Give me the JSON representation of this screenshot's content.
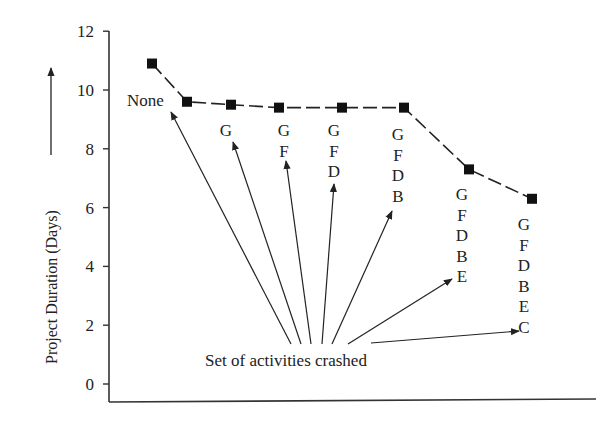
{
  "chart_data": {
    "type": "line",
    "title": "",
    "xlabel": "",
    "ylabel": "Project Duration (Days)",
    "ylim": [
      0,
      12
    ],
    "yticks": [
      0,
      2,
      4,
      6,
      8,
      10,
      12
    ],
    "grid": false,
    "legend": null,
    "line_style": "dashed with square markers",
    "x": [
      0,
      1,
      2,
      3,
      4,
      5,
      6,
      7
    ],
    "values": [
      10.9,
      9.6,
      9.5,
      9.4,
      9.4,
      9.4,
      7.3,
      6.3
    ],
    "point_labels": [
      "",
      "None",
      "G",
      "G F",
      "G F D",
      "G F D B",
      "G F D B E",
      "G F D B E C"
    ],
    "annotations": [
      {
        "text": "Set of activities crashed",
        "points_to": [
          "None",
          "G",
          "G F",
          "G F D",
          "G F D B",
          "G F D B E",
          "G F D B E C"
        ]
      }
    ]
  },
  "axis": {
    "y_ticks": [
      "0",
      "2",
      "4",
      "6",
      "8",
      "10",
      "12"
    ],
    "y_label": "Project Duration (Days)"
  },
  "labels": {
    "none": "None",
    "stacks": [
      [
        "G"
      ],
      [
        "G",
        "F"
      ],
      [
        "G",
        "F",
        "D"
      ],
      [
        "G",
        "F",
        "D",
        "B"
      ],
      [
        "G",
        "F",
        "D",
        "B",
        "E"
      ],
      [
        "G",
        "F",
        "D",
        "B",
        "E",
        "C"
      ]
    ],
    "annotation": "Set of activities crashed"
  }
}
